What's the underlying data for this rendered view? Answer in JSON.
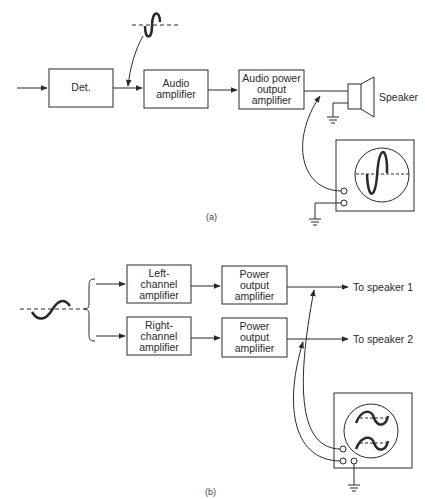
{
  "diagram_a": {
    "blocks": [
      {
        "id": "det",
        "label": "Det."
      },
      {
        "id": "audio-amp",
        "label": "Audio\namplifier"
      },
      {
        "id": "audio-power",
        "label": "Audio power\noutput\namplifier"
      }
    ],
    "speaker_label": "Speaker",
    "caption": "(a)"
  },
  "diagram_b": {
    "blocks": [
      {
        "id": "left-channel",
        "label": "Left-\nchannel\namplifier"
      },
      {
        "id": "right-channel",
        "label": "Right-\nchannel\namplifier"
      },
      {
        "id": "power-out-1",
        "label": "Power\noutput\namplifier"
      },
      {
        "id": "power-out-2",
        "label": "Power\noutput\namplifier"
      }
    ],
    "outputs": [
      "To speaker 1",
      "To speaker 2"
    ],
    "caption": "(b)"
  },
  "colors": {
    "line": "#2a2a2a",
    "background": "#ffffff"
  }
}
